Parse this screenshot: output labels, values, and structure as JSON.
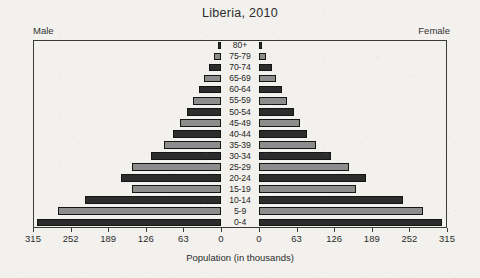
{
  "chart_data": {
    "type": "bar",
    "subtype": "population-pyramid",
    "title": "Liberia, 2010",
    "xlabel": "Population (in thousands)",
    "ylabel": "",
    "grid": false,
    "legend_position": "none",
    "left_label": "Male",
    "right_label": "Female",
    "xlim": [
      0,
      315
    ],
    "xticks": [
      0,
      63,
      126,
      189,
      252,
      315
    ],
    "xtick_labels_left": [
      "315",
      "252",
      "189",
      "126",
      "63",
      "0"
    ],
    "xtick_labels_right": [
      "0",
      "63",
      "126",
      "189",
      "252",
      "315"
    ],
    "categories": [
      "80+",
      "75-79",
      "70-74",
      "65-69",
      "60-64",
      "55-59",
      "50-54",
      "45-49",
      "40-44",
      "35-39",
      "30-34",
      "25-29",
      "20-24",
      "15-19",
      "10-14",
      "5-9",
      "0-4"
    ],
    "series": [
      {
        "name": "Male",
        "side": "left",
        "values": [
          5,
          11,
          20,
          28,
          37,
          47,
          57,
          68,
          80,
          95,
          117,
          149,
          168,
          149,
          228,
          273,
          308
        ]
      },
      {
        "name": "Female",
        "side": "right",
        "values": [
          5,
          12,
          21,
          29,
          38,
          47,
          58,
          68,
          81,
          96,
          120,
          151,
          179,
          163,
          242,
          274,
          307
        ]
      }
    ],
    "bar_shades": [
      "dark",
      "light",
      "dark",
      "light",
      "dark",
      "light",
      "dark",
      "light",
      "dark",
      "light",
      "dark",
      "light",
      "dark",
      "light",
      "dark",
      "light",
      "dark"
    ]
  },
  "colors": {
    "bar_dark": "#2c2c2c",
    "bar_light": "#8d8d8d",
    "frame": "#3a3a3a",
    "background": "#f2f1ed",
    "text": "#2b2b2b"
  }
}
